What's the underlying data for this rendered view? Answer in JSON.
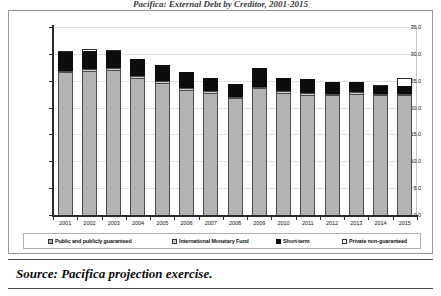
{
  "figure": {
    "title_cut": "Pacifica: External Debt by Creditor, 2001-2015",
    "source_label": "Source: Pacifica projection exercise."
  },
  "legend": {
    "position": "bottom",
    "items": [
      {
        "label": "Public and publicly guaranteed",
        "color": "#b3b3b3",
        "marker": "square-light-gray"
      },
      {
        "label": "International Monetary Fund",
        "color": "#c9c9c9",
        "marker": "square-gray"
      },
      {
        "label": "Short-term",
        "color": "#0d0d0d",
        "marker": "square-black"
      },
      {
        "label": "Private non-guaranteed",
        "color": "#ffffff",
        "marker": "square-white"
      }
    ]
  },
  "axes": {
    "y_ticks": [
      "0.0",
      "5.0",
      "10.0",
      "15.0",
      "20.0",
      "25.0",
      "30.0",
      "35.0"
    ],
    "y_min": 0.0,
    "y_max": 35.0,
    "y_step": 5.0
  },
  "chart_data": {
    "type": "bar",
    "stacked": true,
    "title": "Pacifica: External Debt by Creditor, 2001-2015",
    "xlabel": "",
    "ylabel": "",
    "ylim": [
      0.0,
      35.0
    ],
    "ystep": 5.0,
    "grid": true,
    "legend_position": "bottom",
    "categories": [
      "2001",
      "2002",
      "2003",
      "2004",
      "2005",
      "2006",
      "2007",
      "2008",
      "2009",
      "2010",
      "2011",
      "2012",
      "2013",
      "2014",
      "2015"
    ],
    "series": [
      {
        "name": "Public and publicly guaranteed",
        "color": "#b3b3b3",
        "values": [
          26.6,
          26.9,
          27.0,
          25.6,
          24.6,
          23.3,
          22.7,
          21.7,
          23.6,
          22.7,
          22.4,
          22.3,
          22.6,
          22.3,
          22.3
        ]
      },
      {
        "name": "International Monetary Fund",
        "color": "#c9c9c9",
        "values": [
          0.3,
          0.3,
          0.3,
          0.3,
          0.3,
          0.3,
          0.3,
          0.3,
          0.3,
          0.3,
          0.3,
          0.3,
          0.3,
          0.3,
          0.3
        ]
      },
      {
        "name": "Short-term",
        "color": "#0d0d0d",
        "values": [
          3.4,
          3.4,
          3.2,
          3.1,
          3.1,
          3.0,
          2.5,
          2.4,
          3.5,
          2.6,
          2.6,
          2.1,
          1.8,
          1.4,
          1.4
        ]
      },
      {
        "name": "Private non-guaranteed",
        "color": "#ffffff",
        "values": [
          0.3,
          0.3,
          0.3,
          0.0,
          0.0,
          0.0,
          0.0,
          0.0,
          0.0,
          0.0,
          0.0,
          0.0,
          0.0,
          0.2,
          1.5
        ]
      }
    ],
    "totals": [
      30.6,
      30.9,
      30.8,
      29.0,
      28.0,
      26.6,
      25.5,
      24.4,
      27.4,
      25.6,
      25.3,
      24.7,
      24.7,
      24.2,
      25.5
    ]
  }
}
